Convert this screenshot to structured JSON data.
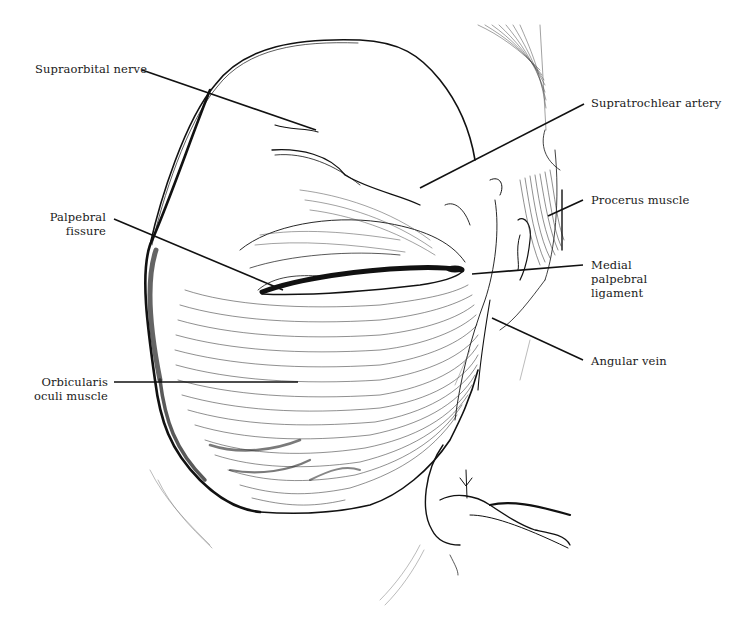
{
  "figure": {
    "colors": {
      "ink": "#111111",
      "background": "#ffffff",
      "hatch": "#555555"
    }
  },
  "labels": {
    "supraorbital_nerve": {
      "lines": [
        "Supraorbital nerve"
      ]
    },
    "supratrochlear_artery": {
      "lines": [
        "Supratrochlear artery"
      ]
    },
    "procerus_muscle": {
      "lines": [
        "Procerus muscle"
      ]
    },
    "palpebral_fissure": {
      "lines": [
        "Palpebral",
        "fissure"
      ]
    },
    "medial_palpebral_ligament": {
      "lines": [
        "Medial",
        "palpebral",
        "ligament"
      ]
    },
    "angular_vein": {
      "lines": [
        "Angular vein"
      ]
    },
    "orbicularis_oculi_muscle": {
      "lines": [
        "Orbicularis",
        "oculi muscle"
      ]
    }
  }
}
